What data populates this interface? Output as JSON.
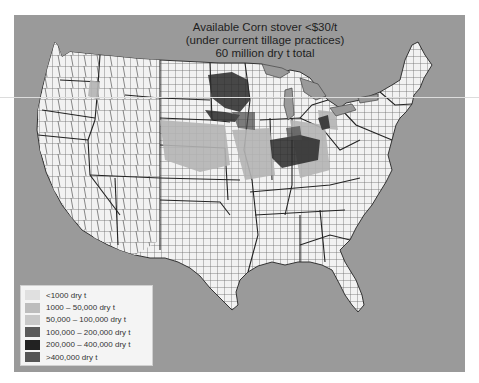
{
  "title": {
    "line1": "Available Corn stover <$30/t",
    "line2": "(under current tillage practices)",
    "line3": "60 million dry t total"
  },
  "legend": {
    "items": [
      {
        "label": "<1000 dry t",
        "color": "#e0e0e0"
      },
      {
        "label": "1000 – 50,000 dry t",
        "color": "#bdbdbd"
      },
      {
        "label": "50,000 – 100,000 dry t",
        "color": "#c8c8c8"
      },
      {
        "label": "100,000 – 200,000 dry t",
        "color": "#5a5a5a"
      },
      {
        "label": "200,000 – 400,000 dry t",
        "color": "#222222"
      },
      {
        "label": ">400,000 dry t",
        "color": "#555555"
      }
    ]
  },
  "colors": {
    "background": "#9a9a9a",
    "land": "#f2f2f2",
    "county_lines": "#555555",
    "state_lines": "#222222"
  }
}
